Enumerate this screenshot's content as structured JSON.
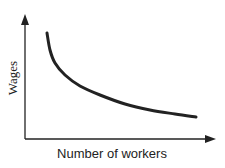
{
  "chart_data": {
    "type": "line",
    "title": "",
    "xlabel": "Number of workers",
    "ylabel": "Wages",
    "grid": false,
    "legend": null,
    "series": [
      {
        "name": "Labour demand curve",
        "points_px": [
          [
            47,
            33
          ],
          [
            50,
            50
          ],
          [
            55,
            63
          ],
          [
            65,
            75
          ],
          [
            80,
            86
          ],
          [
            100,
            95
          ],
          [
            125,
            104
          ],
          [
            150,
            110
          ],
          [
            175,
            114
          ],
          [
            196,
            117
          ]
        ]
      }
    ],
    "xlim": [
      0,
      null
    ],
    "ylim": [
      0,
      null
    ],
    "axes": {
      "x_arrow": true,
      "y_arrow": true,
      "ticks": false
    }
  },
  "colors": {
    "line": "#222222",
    "axis": "#222222",
    "background": "#ffffff"
  }
}
